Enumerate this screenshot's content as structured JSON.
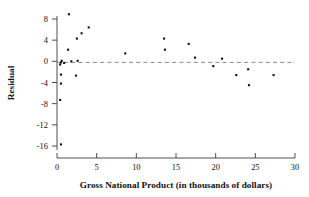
{
  "chart_data": {
    "type": "scatter",
    "title": "",
    "xlabel": "Gross National Product (in thousands of dollars)",
    "ylabel": "Residual",
    "xlim": [
      0,
      30
    ],
    "ylim": [
      -17.5,
      10
    ],
    "xticks": [
      0,
      5,
      10,
      15,
      20,
      25,
      30
    ],
    "xtick_labels": [
      "0",
      "5",
      "10",
      "15",
      "20",
      "25",
      "30"
    ],
    "yticks": [
      8,
      4,
      0,
      -4,
      -8,
      -12,
      -16
    ],
    "ytick_labels": [
      "8",
      "4",
      "0",
      "-4",
      "-8",
      "-12",
      "-16"
    ],
    "grid": false,
    "legend": null,
    "reference_line": {
      "type": "horizontal",
      "y": -0.2,
      "style": "dashed",
      "color": "#8a8a8a"
    },
    "marker": {
      "shape": "square",
      "color": "#101010",
      "size": 2.1
    },
    "points": [
      {
        "x": 0.5,
        "y": -15.7
      },
      {
        "x": 0.4,
        "y": -7.3
      },
      {
        "x": 0.5,
        "y": -4.2
      },
      {
        "x": 0.5,
        "y": -2.5
      },
      {
        "x": 0.4,
        "y": -0.6
      },
      {
        "x": 0.5,
        "y": -0.2
      },
      {
        "x": 0.6,
        "y": 0.1
      },
      {
        "x": 0.9,
        "y": -0.3
      },
      {
        "x": 1.5,
        "y": 8.9
      },
      {
        "x": 1.4,
        "y": 2.2
      },
      {
        "x": 1.8,
        "y": 0.0
      },
      {
        "x": 2.4,
        "y": -2.7
      },
      {
        "x": 2.5,
        "y": 4.3
      },
      {
        "x": 2.6,
        "y": 0.1
      },
      {
        "x": 3.1,
        "y": 5.3
      },
      {
        "x": 4.0,
        "y": 6.4
      },
      {
        "x": 8.6,
        "y": 1.5
      },
      {
        "x": 13.5,
        "y": 4.3
      },
      {
        "x": 13.6,
        "y": 2.2
      },
      {
        "x": 16.6,
        "y": 3.3
      },
      {
        "x": 17.4,
        "y": 0.7
      },
      {
        "x": 19.7,
        "y": -0.9
      },
      {
        "x": 20.8,
        "y": 0.5
      },
      {
        "x": 22.6,
        "y": -2.6
      },
      {
        "x": 24.1,
        "y": -1.5
      },
      {
        "x": 24.2,
        "y": -4.5
      },
      {
        "x": 27.3,
        "y": -2.6
      }
    ]
  },
  "figure": {
    "background_color": "#ffffff",
    "axis_color": "#3a3a3a",
    "text_color": "#111111"
  }
}
